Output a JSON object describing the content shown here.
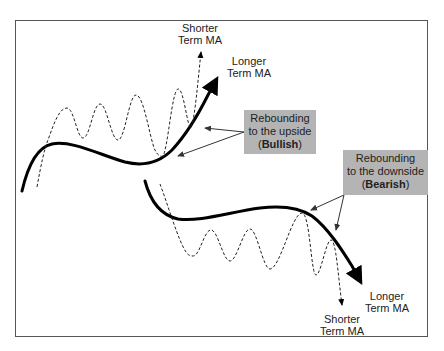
{
  "diagram": {
    "labels": {
      "top_shorter": {
        "line1": "Shorter",
        "line2": "Term MA"
      },
      "top_longer": {
        "line1": "Longer",
        "line2": "Term MA"
      },
      "bottom_longer": {
        "line1": "Longer",
        "line2": "Term MA"
      },
      "bottom_shorter": {
        "line1": "Shorter",
        "line2": "Term MA"
      }
    },
    "callouts": {
      "bullish": {
        "line1": "Rebounding",
        "line2": "to the upside",
        "open": "(",
        "emphasis": "Bullish",
        "close": ")"
      },
      "bearish": {
        "line1": "Rebounding",
        "line2": "to the downside",
        "open": "(",
        "emphasis": "Bearish",
        "close": ")"
      }
    },
    "colors": {
      "callout_fill": "#b4b4b4",
      "line": "#000000",
      "frame": "#555555"
    }
  }
}
